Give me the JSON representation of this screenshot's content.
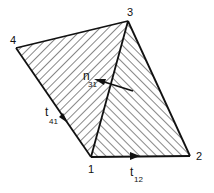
{
  "vertices": {
    "v1": {
      "label": "1"
    },
    "v2": {
      "label": "2"
    },
    "v3": {
      "label": "3"
    },
    "v4": {
      "label": "4"
    }
  },
  "vectors": {
    "t41": {
      "main": "t",
      "sub": "41"
    },
    "t12": {
      "main": "t",
      "sub": "12"
    },
    "n31": {
      "main": "n",
      "sub": "31"
    }
  },
  "colors": {
    "stroke": "#111111",
    "background": "#ffffff"
  }
}
